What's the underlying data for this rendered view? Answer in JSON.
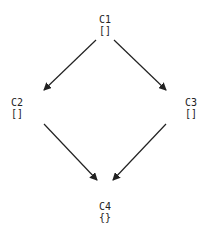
{
  "diagram": {
    "type": "directed-graph",
    "nodes": [
      {
        "id": "C1",
        "label": "C1",
        "value": "[]"
      },
      {
        "id": "C2",
        "label": "C2",
        "value": "[]"
      },
      {
        "id": "C3",
        "label": "C3",
        "value": "[]"
      },
      {
        "id": "C4",
        "label": "C4",
        "value": "{}"
      }
    ],
    "edges": [
      {
        "from": "C1",
        "to": "C2"
      },
      {
        "from": "C1",
        "to": "C3"
      },
      {
        "from": "C2",
        "to": "C4"
      },
      {
        "from": "C3",
        "to": "C4"
      }
    ],
    "colors": {
      "line": "#222222",
      "text": "#222222",
      "background": "#ffffff"
    }
  }
}
